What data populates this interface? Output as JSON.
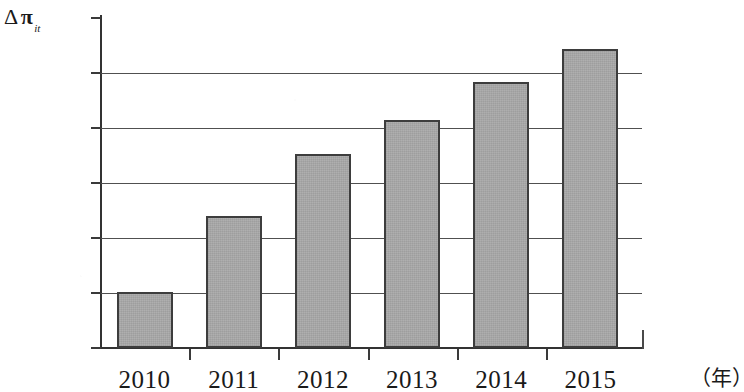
{
  "chart_data": {
    "type": "bar",
    "title": "",
    "subtitle": "",
    "xlabel": "（年）",
    "ylabel": "Δπ",
    "ylabel_parts": {
      "delta": "Δ",
      "pi": "π",
      "subscript": "it"
    },
    "categories": [
      "2010",
      "2011",
      "2012",
      "2013",
      "2014",
      "2015"
    ],
    "values": [
      0.102,
      0.24,
      0.353,
      0.415,
      0.483,
      0.543
    ],
    "series": [
      {
        "name": "Δπ it",
        "values": [
          0.102,
          0.24,
          0.353,
          0.415,
          0.483,
          0.543
        ]
      }
    ],
    "ylim": [
      0,
      0.6
    ],
    "y_ticks": [
      "0",
      "0.1",
      "0.2",
      "0.3",
      "0.4",
      "0.5",
      "0.6"
    ],
    "y_tick_values": [
      0,
      0.1,
      0.2,
      0.3,
      0.4,
      0.5,
      0.6
    ],
    "grid": true,
    "grid_axis": "y",
    "legend": false,
    "legend_position": "none",
    "bar_fill_color": "#a9a9a9",
    "bar_border_color": "#3d3d3d",
    "axis_color": "#333333",
    "gridline_color": "#505050",
    "background_color": "#ffffff"
  }
}
